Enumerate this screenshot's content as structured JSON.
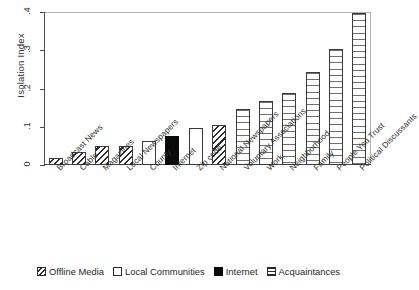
{
  "chart_data": {
    "type": "bar",
    "title": "",
    "subtitle": "",
    "xlabel": "",
    "ylabel": "Isolation Index",
    "ylim": [
      0,
      0.4
    ],
    "yticks": [
      ".4",
      ".3",
      ".2",
      ".1",
      "0"
    ],
    "ytick_values": [
      0.4,
      0.3,
      0.2,
      0.1,
      0.0
    ],
    "grid": false,
    "legend_position": "bottom-center",
    "categories": [
      "Broadcast News",
      "Cable",
      "Magazines",
      "Local Newspapers",
      "County",
      "Internet",
      "Zip code",
      "National Newspapers",
      "Voluntary Associations",
      "Work",
      "Neighborhood",
      "Family",
      "People You Trust",
      "Political Discussants"
    ],
    "values": [
      0.018,
      0.033,
      0.05,
      0.05,
      0.063,
      0.077,
      0.096,
      0.105,
      0.146,
      0.168,
      0.189,
      0.244,
      0.303,
      0.398
    ],
    "groups": [
      "offline-media",
      "offline-media",
      "offline-media",
      "offline-media",
      "local-communities",
      "internet",
      "local-communities",
      "offline-media",
      "acquaintances",
      "acquaintances",
      "acquaintances",
      "acquaintances",
      "acquaintances",
      "acquaintances"
    ],
    "legend": [
      {
        "key": "offline-media",
        "label": "Offline Media",
        "pattern": "diagonal-hatch",
        "color": "#ffffff"
      },
      {
        "key": "local-communities",
        "label": "Local Communities",
        "pattern": "solid-white",
        "color": "#ffffff"
      },
      {
        "key": "internet",
        "label": "Internet",
        "pattern": "solid-black",
        "color": "#0a0a0a"
      },
      {
        "key": "acquaintances",
        "label": "Acquaintances",
        "pattern": "horizontal-lines",
        "color": "#ffffff"
      }
    ]
  }
}
